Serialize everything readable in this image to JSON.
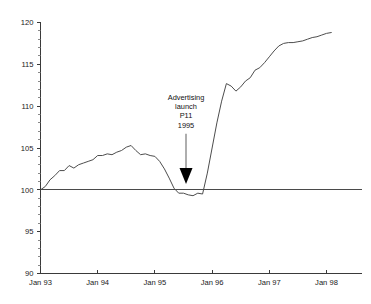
{
  "chart_data": {
    "type": "line",
    "title": "",
    "xlabel": "",
    "ylabel": "",
    "ylim": [
      90,
      120
    ],
    "yticks": [
      90,
      95,
      100,
      105,
      110,
      115,
      120
    ],
    "ytick_labels": [
      "90",
      "95",
      "100",
      "105",
      "110",
      "115",
      "120"
    ],
    "xticks": [
      "Jan 93",
      "Jan 94",
      "Jan 95",
      "Jan 96",
      "Jan 97",
      "Jan 98"
    ],
    "xtick_labels": [
      "Jan 93",
      "Jan 94",
      "Jan 95",
      "Jan 96",
      "Jan 97",
      "Jan 98"
    ],
    "grid": false,
    "legend": "none",
    "reference_line": {
      "value": 100,
      "label": "100 index baseline"
    },
    "annotations": [
      {
        "name": "advertising-launch",
        "lines": [
          "Advertising",
          "launch",
          "P11",
          "1995"
        ],
        "points_to_x": "P11 1995",
        "points_to_y": 100
      }
    ],
    "series": [
      {
        "name": "Index",
        "x": [
          "Jan 93",
          "Feb 93",
          "Mar 93",
          "Apr 93",
          "May 93",
          "Jun 93",
          "Jul 93",
          "Aug 93",
          "Sep 93",
          "Oct 93",
          "Nov 93",
          "Dec 93",
          "Jan 94",
          "Feb 94",
          "Mar 94",
          "Apr 94",
          "May 94",
          "Jun 94",
          "Jul 94",
          "Aug 94",
          "Sep 94",
          "Oct 94",
          "Nov 94",
          "Dec 94",
          "Jan 95",
          "Feb 95",
          "Mar 95",
          "Apr 95",
          "May 95",
          "Jun 95",
          "Jul 95",
          "Aug 95",
          "Sep 95",
          "Oct 95",
          "Nov 95",
          "Dec 95",
          "Jan 96",
          "Feb 96",
          "Mar 96",
          "Apr 96",
          "May 96",
          "Jun 96",
          "Jul 96",
          "Aug 96",
          "Sep 96",
          "Oct 96",
          "Nov 96",
          "Dec 96",
          "Jan 97",
          "Feb 97",
          "Mar 97",
          "Apr 97",
          "May 97",
          "Jun 97",
          "Jul 97",
          "Aug 97",
          "Sep 97",
          "Oct 97",
          "Nov 97",
          "Dec 97",
          "Jan 98",
          "Feb 98"
        ],
        "values": [
          100.0,
          100.4,
          101.2,
          101.7,
          102.3,
          102.3,
          102.9,
          102.6,
          103.0,
          103.2,
          103.4,
          103.6,
          104.1,
          104.1,
          104.3,
          104.2,
          104.5,
          104.7,
          105.1,
          105.3,
          104.7,
          104.2,
          104.3,
          104.1,
          104.0,
          103.4,
          102.5,
          101.4,
          100.2,
          99.6,
          99.6,
          99.4,
          99.3,
          99.6,
          99.5,
          102.0,
          105.0,
          108.0,
          110.6,
          112.7,
          112.4,
          111.8,
          112.3,
          113.0,
          113.4,
          114.3,
          114.6,
          115.2,
          115.9,
          116.6,
          117.2,
          117.5,
          117.6,
          117.6,
          117.7,
          117.8,
          118.0,
          118.2,
          118.3,
          118.5,
          118.7,
          118.8
        ]
      }
    ]
  }
}
